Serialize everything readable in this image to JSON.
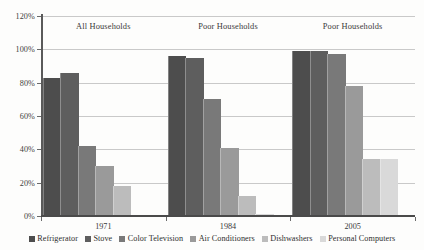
{
  "chart_data": {
    "type": "bar",
    "title": "",
    "xlabel": "",
    "ylabel": "",
    "ylim": [
      0,
      120
    ],
    "grid": true,
    "legend_position": "bottom",
    "categories": [
      "1971",
      "1984",
      "2005"
    ],
    "group_annotations": [
      "All Households",
      "Poor Households",
      "Poor Households"
    ],
    "ytick_labels": [
      "0%",
      "20%",
      "40%",
      "60%",
      "80%",
      "100%",
      "120%"
    ],
    "ytick_values": [
      0,
      20,
      40,
      60,
      80,
      100,
      120
    ],
    "series": [
      {
        "name": "Refrigerator",
        "color": "#4d4d4d",
        "values": [
          83,
          96,
          99
        ]
      },
      {
        "name": "Stove",
        "color": "#5e5e5e",
        "values": [
          86,
          95,
          99
        ]
      },
      {
        "name": "Color Television",
        "color": "#797979",
        "values": [
          42,
          70,
          97
        ]
      },
      {
        "name": "Air Conditioners",
        "color": "#9a9a9a",
        "values": [
          30,
          41,
          78
        ]
      },
      {
        "name": "Dishwashers",
        "color": "#bcbcbc",
        "values": [
          18,
          12,
          34
        ]
      },
      {
        "name": "Personal Computers",
        "color": "#d9d9d9",
        "values": [
          0,
          1.5,
          34
        ]
      }
    ]
  },
  "colors": {
    "background": "#fdfdfc",
    "axis": "#4a4a4a",
    "gridline": "#c9c9c9",
    "text": "#3a3a3a"
  }
}
